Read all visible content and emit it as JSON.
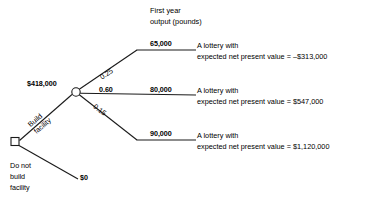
{
  "diagram": {
    "type": "decision-tree",
    "title_block": {
      "line1": "First year",
      "line2": "output (pounds)"
    },
    "decision_node": {
      "name": "decision-node",
      "shape": "square"
    },
    "chance_node": {
      "name": "chance-node",
      "shape": "circle",
      "value_label": "$418,000"
    },
    "decision_branches": [
      {
        "label_line1": "Build",
        "label_line2": "facility",
        "payoff": ""
      },
      {
        "label_line1": "Do not",
        "label_line2": "build",
        "label_line3": "facility",
        "payoff": "$0"
      }
    ],
    "chance_branches": [
      {
        "probability": "0.25",
        "output": "65,000",
        "outcome_line1": "A lottery with",
        "outcome_line2": "expected net present value = –$313,000"
      },
      {
        "probability": "0.60",
        "output": "80,000",
        "outcome_line1": "A lottery with",
        "outcome_line2": "expected net present value = $547,000"
      },
      {
        "probability": "0.15",
        "output": "90,000",
        "outcome_line1": "A lottery with",
        "outcome_line2": "expected net present value = $1,120,000"
      }
    ],
    "colors": {
      "stroke": "#1a1a1a",
      "background": "#ffffff",
      "text": "#000000"
    }
  }
}
